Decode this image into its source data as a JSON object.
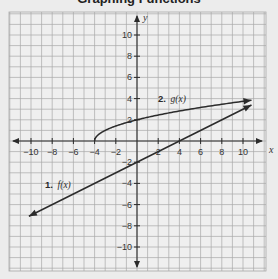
{
  "title_fragment": "Graphing Functions",
  "chart_data": {
    "type": "line",
    "title": "",
    "xlabel": "x",
    "ylabel": "y",
    "xlim": [
      -12,
      12
    ],
    "ylim": [
      -12,
      12
    ],
    "grid": true,
    "x_ticks": [
      -10,
      -8,
      -6,
      -4,
      -2,
      2,
      4,
      6,
      8,
      10
    ],
    "y_ticks": [
      10,
      8,
      6,
      4,
      2,
      -2,
      -4,
      -6,
      -8,
      -10
    ],
    "x_tick_labels": [
      "−10",
      "−8",
      "−6",
      "−4",
      "−2",
      "2",
      "4",
      "6",
      "8",
      "10"
    ],
    "y_tick_labels": [
      "10",
      "8",
      "6",
      "4",
      "2",
      "−2",
      "−4",
      "−6",
      "−8",
      "−10"
    ],
    "series": [
      {
        "name": "1. f(x)",
        "label_num": "1.",
        "label_fn": "f(x)",
        "equation": "f(x) = x/2 - 2",
        "kind": "linear",
        "x": [
          -10.2,
          -4,
          0,
          4,
          10.8
        ],
        "y": [
          -7.1,
          -4,
          -2,
          0,
          3.4
        ],
        "arrows": "both",
        "color": "#2b2b2b"
      },
      {
        "name": "2. g(x)",
        "label_num": "2.",
        "label_fn": "g(x)",
        "equation": "g(x) = sqrt(x + 4)",
        "kind": "sqrt",
        "x": [
          -4,
          -3,
          0,
          5,
          10.8
        ],
        "y": [
          0,
          1,
          2,
          3,
          3.85
        ],
        "arrows": "end",
        "color": "#2b2b2b"
      }
    ],
    "legend_position": "inline labels near curves"
  },
  "colors": {
    "background": "#ececec",
    "grid_line": "#a9a9a9",
    "axis": "#2b2b2b",
    "curve": "#2b2b2b"
  }
}
